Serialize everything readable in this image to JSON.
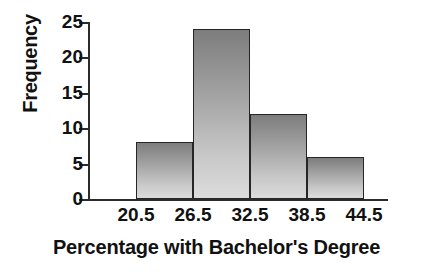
{
  "chart_data": {
    "type": "bar",
    "title": "",
    "subtitle": "",
    "xlabel": "Percentage with Bachelor's Degree",
    "ylabel": "Frequency",
    "categories": [
      "20.5-26.5",
      "26.5-32.5",
      "32.5-38.5",
      "38.5-44.5"
    ],
    "values": [
      8,
      24,
      12,
      6
    ],
    "bin_edges": [
      20.5,
      26.5,
      32.5,
      38.5,
      44.5
    ],
    "bin_width": 6,
    "x_tick_labels": [
      "20.5",
      "26.5",
      "32.5",
      "38.5",
      "44.5"
    ],
    "y_tick_labels": [
      "0",
      "5",
      "10",
      "15",
      "20",
      "25"
    ],
    "y_ticks": [
      0,
      5,
      10,
      15,
      20,
      25
    ],
    "ylim": [
      0,
      25
    ],
    "xlim": [
      20.5,
      44.5
    ],
    "grid": false,
    "legend": false,
    "legend_position": "none",
    "total_frequency": 50,
    "colors": {
      "bar_fill_top": "#7d7d7d",
      "bar_fill_bottom": "#dcdcdc",
      "bar_outline": "#262626",
      "axis": "#2b2b2b",
      "text": "#111111",
      "background": "#ffffff"
    }
  },
  "axes": {
    "y_title": "Frequency",
    "x_title": "Percentage with Bachelor's Degree"
  }
}
